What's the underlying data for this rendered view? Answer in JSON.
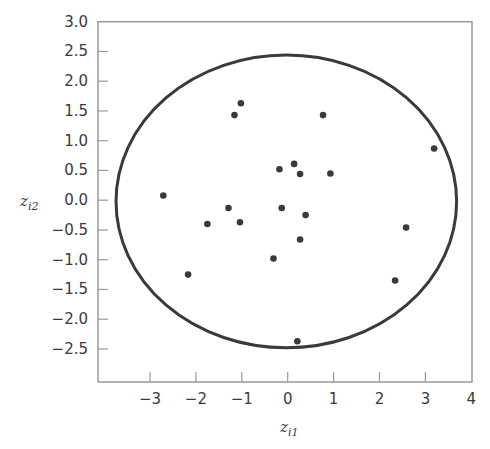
{
  "chart_data": {
    "type": "scatter",
    "title": "",
    "xlabel": "z_i1",
    "ylabel": "z_i2",
    "xlabel_parts": {
      "base": "z",
      "sub": "i1"
    },
    "ylabel_parts": {
      "base": "z",
      "sub": "i2"
    },
    "xlim": [
      -4,
      4
    ],
    "ylim": [
      -3.05,
      3.0
    ],
    "xticks": [
      -3,
      -2,
      -1,
      0,
      1,
      2,
      3,
      4
    ],
    "xtick_labels": [
      "−3",
      "−2",
      "−1",
      "0",
      "1",
      "2",
      "3",
      "4"
    ],
    "yticks": [
      3.0,
      2.5,
      2.0,
      1.5,
      1.0,
      0.5,
      0.0,
      -0.5,
      -1.0,
      -1.5,
      -2.0,
      -2.5
    ],
    "ytick_labels": [
      "3.0",
      "2.5",
      "2.0",
      "1.5",
      "1.0",
      "0.5",
      "0.0",
      "−0.5",
      "−1.0",
      "−1.5",
      "−2.0",
      "−2.5"
    ],
    "grid": false,
    "legend": null,
    "series": [
      {
        "name": "observations",
        "marker": "filled-circle",
        "color": "#3a3a3a",
        "x": [
          -1.02,
          -1.16,
          0.77,
          -0.18,
          0.14,
          0.27,
          0.93,
          3.19,
          -2.71,
          -1.29,
          -0.13,
          -1.75,
          -1.04,
          0.39,
          2.58,
          0.27,
          -0.31,
          -2.17,
          2.34,
          0.21
        ],
        "y": [
          1.63,
          1.43,
          1.43,
          0.52,
          0.61,
          0.44,
          0.45,
          0.87,
          0.08,
          -0.13,
          -0.13,
          -0.4,
          -0.37,
          -0.25,
          -0.46,
          -0.66,
          -0.98,
          -1.25,
          -1.35,
          -2.37
        ]
      }
    ],
    "annotations": [
      {
        "type": "ellipse",
        "label": "control ellipse",
        "center": [
          -0.03,
          -0.02
        ],
        "semi_axis_x": 3.71,
        "semi_axis_y": 2.46,
        "color": "#3a3a3a"
      }
    ]
  },
  "style": {
    "frame_color": "#9a9a9a",
    "ink_color": "#3a3a3a",
    "background": "#ffffff"
  }
}
